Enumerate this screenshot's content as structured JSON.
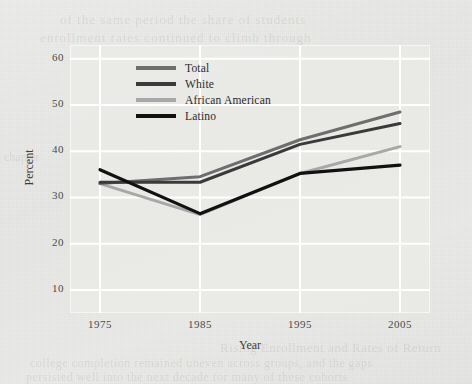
{
  "page": {
    "background_color": "#e9e9e7",
    "ghost_text": {
      "top_1": "of the same period the share of students",
      "top_2": "enrollment rates continued to climb through",
      "bottom_1": "Rising Enrollment and Rates of Return",
      "bottom_2": "college completion remained uneven across groups, and the gaps",
      "bottom_3": "persisted well into the next decade for many of these cohorts",
      "left": "chapter"
    }
  },
  "chart_data": {
    "type": "line",
    "title": "",
    "xlabel": "Year",
    "ylabel": "Percent",
    "x": [
      1975,
      1985,
      1995,
      2005
    ],
    "xtick_labels": [
      "1975",
      "1985",
      "1995",
      "2005"
    ],
    "ytick_labels": [
      "60",
      "50",
      "40",
      "30",
      "20",
      "10"
    ],
    "yticks": [
      60,
      50,
      40,
      30,
      20,
      10
    ],
    "ylim": [
      5,
      63
    ],
    "xlim": [
      1972,
      2008
    ],
    "grid": true,
    "grid_color": "#ffffff",
    "legend_position": "upper-left-inside",
    "series": [
      {
        "name": "Total",
        "color": "#6e6e6e",
        "width": 3.0,
        "values": [
          33.0,
          34.5,
          42.5,
          48.5
        ]
      },
      {
        "name": "White",
        "color": "#3a3a3a",
        "width": 3.0,
        "values": [
          33.3,
          33.3,
          41.5,
          46.0
        ]
      },
      {
        "name": "African American",
        "color": "#a8a8a8",
        "width": 3.0,
        "values": [
          33.0,
          26.3,
          35.2,
          41.0
        ]
      },
      {
        "name": "Latino",
        "color": "#111111",
        "width": 3.2,
        "values": [
          36.0,
          26.5,
          35.2,
          37.0
        ]
      }
    ]
  }
}
